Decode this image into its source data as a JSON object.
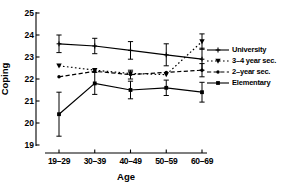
{
  "chart_data": {
    "type": "line",
    "xlabel": "Age",
    "ylabel": "Coping",
    "ylim": [
      19,
      25
    ],
    "yticks": [
      25,
      24,
      23,
      22,
      21,
      20,
      19
    ],
    "categories": [
      "19–29",
      "30–39",
      "40–49",
      "50–59",
      "60–69"
    ],
    "grid": false,
    "legend_position": "right",
    "color": "#000000",
    "series": [
      {
        "id": "university",
        "name": "University",
        "values": [
          23.6,
          23.5,
          23.3,
          23.1,
          22.9
        ],
        "errors": [
          0.4,
          0.35,
          0.4,
          0.5,
          0.5
        ],
        "line": "solid",
        "marker": "plus"
      },
      {
        "id": "3-4-year-sec",
        "name": "3–4 year sec.",
        "values": [
          22.6,
          22.4,
          22.25,
          22.2,
          23.7
        ],
        "errors": [
          0,
          0,
          0,
          0,
          0.35
        ],
        "line": "dotted",
        "marker": "triangle-down"
      },
      {
        "id": "2-year-sec",
        "name": "2–year sec.",
        "values": [
          22.1,
          22.35,
          22.2,
          22.3,
          22.4
        ],
        "errors": [
          0,
          0,
          0.2,
          0,
          0.3
        ],
        "line": "dashed",
        "marker": "dot"
      },
      {
        "id": "elementary",
        "name": "Elementary",
        "values": [
          20.4,
          21.8,
          21.5,
          21.6,
          21.4
        ],
        "errors": [
          1.0,
          0.5,
          0.4,
          0.35,
          0.45
        ],
        "line": "solid",
        "marker": "square"
      }
    ]
  }
}
